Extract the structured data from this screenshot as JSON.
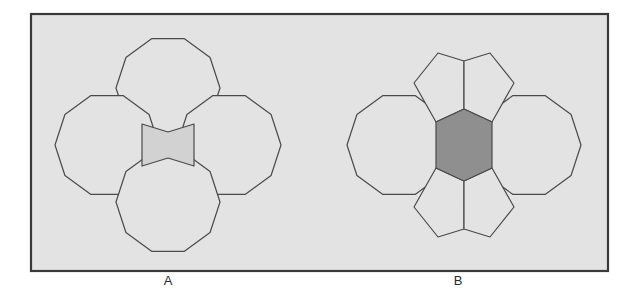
{
  "figure": {
    "background_color": "#ffffff",
    "frame": {
      "fill": "#e3e3e3",
      "stroke": "#3a3a3a",
      "x": 31,
      "y": 14,
      "width": 577,
      "height": 257
    },
    "stroke_color": "#4a4a4a",
    "panels": [
      {
        "id": "A",
        "label": "A",
        "label_x": 168,
        "label_y": 285,
        "center_shape": {
          "name": "bowtie-gap",
          "fill": "#d2d2d2",
          "sides": 6,
          "concave": true
        },
        "polygons": [
          {
            "name": "decagon-top",
            "sides": 10,
            "cx": 168,
            "cy": 88,
            "r": 52,
            "fill": "#e3e3e3"
          },
          {
            "name": "decagon-left",
            "sides": 10,
            "cx": 107,
            "cy": 145,
            "r": 52,
            "fill": "#e3e3e3"
          },
          {
            "name": "decagon-right",
            "sides": 10,
            "cx": 229,
            "cy": 145,
            "r": 52,
            "fill": "#e3e3e3"
          },
          {
            "name": "decagon-bottom",
            "sides": 10,
            "cx": 168,
            "cy": 202,
            "r": 52,
            "fill": "#e3e3e3"
          }
        ]
      },
      {
        "id": "B",
        "label": "B",
        "label_x": 458,
        "label_y": 285,
        "center_shape": {
          "name": "shaded-hexagon",
          "fill": "#8f8f8f",
          "sides": 6,
          "concave": false,
          "cx": 464,
          "cy": 145,
          "r": 37
        },
        "polygons": [
          {
            "name": "decagon-left",
            "sides": 10,
            "cx": 399,
            "cy": 145,
            "r": 52,
            "fill": "#e3e3e3"
          },
          {
            "name": "decagon-right",
            "sides": 10,
            "cx": 529,
            "cy": 145,
            "r": 52,
            "fill": "#e3e3e3"
          }
        ],
        "pentagons": [
          {
            "name": "pentagon-top-left",
            "fill": "#e3e3e3"
          },
          {
            "name": "pentagon-top-right",
            "fill": "#e3e3e3"
          },
          {
            "name": "pentagon-bottom-left",
            "fill": "#e3e3e3"
          },
          {
            "name": "pentagon-bottom-right",
            "fill": "#e3e3e3"
          }
        ]
      }
    ]
  },
  "chart_data": {
    "type": "diagram",
    "panels": [
      "A",
      "B"
    ],
    "panel_A": {
      "decagon_count": 4,
      "decagon_radius": 52,
      "gap_shape": "concave hexagon (bowtie)",
      "gap_fill": "#d2d2d2"
    },
    "panel_B": {
      "decagon_count": 2,
      "pentagon_count": 4,
      "hexagon_count": 1,
      "decagon_radius": 52,
      "hexagon_fill": "#8f8f8f"
    }
  }
}
